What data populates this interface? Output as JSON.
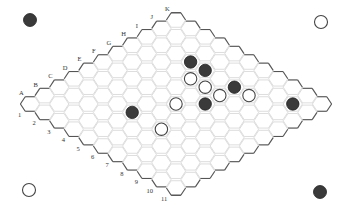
{
  "game": {
    "type": "Hex",
    "size": 11,
    "columns": [
      "A",
      "B",
      "C",
      "D",
      "E",
      "F",
      "G",
      "H",
      "I",
      "J",
      "K"
    ],
    "rows": [
      "1",
      "2",
      "3",
      "4",
      "5",
      "6",
      "7",
      "8",
      "9",
      "10",
      "11"
    ]
  },
  "colors": {
    "black": "#3a3a3a",
    "white": "#ffffff",
    "grid": "#d4d4d4",
    "edge": "#555555"
  },
  "corner_markers": [
    {
      "position": "top-left",
      "color": "black"
    },
    {
      "position": "top-right",
      "color": "white"
    },
    {
      "position": "bottom-left",
      "color": "white"
    },
    {
      "position": "bottom-right",
      "color": "black"
    }
  ],
  "stones": [
    {
      "cell": "I4",
      "color": "black"
    },
    {
      "cell": "I5",
      "color": "black"
    },
    {
      "cell": "H5",
      "color": "white"
    },
    {
      "cell": "H6",
      "color": "white"
    },
    {
      "cell": "I7",
      "color": "black"
    },
    {
      "cell": "H7",
      "color": "white"
    },
    {
      "cell": "I8",
      "color": "white"
    },
    {
      "cell": "G7",
      "color": "black"
    },
    {
      "cell": "F6",
      "color": "white"
    },
    {
      "cell": "J10",
      "color": "black"
    },
    {
      "cell": "D5",
      "color": "black"
    },
    {
      "cell": "D7",
      "color": "white"
    }
  ]
}
